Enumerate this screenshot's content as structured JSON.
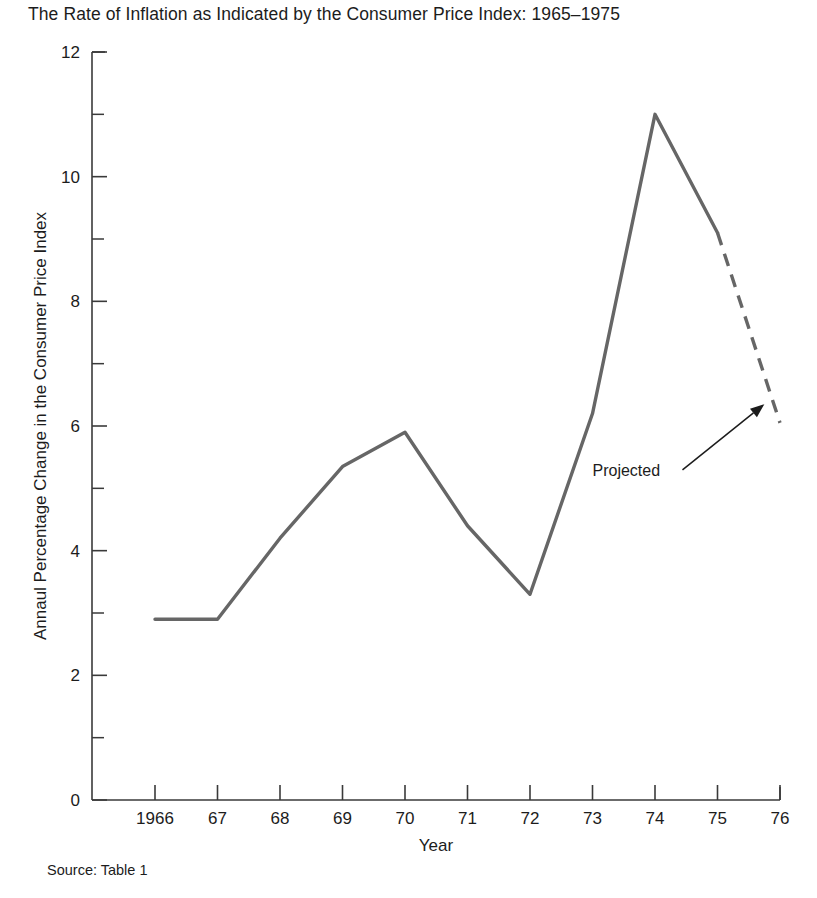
{
  "chart_data": {
    "type": "line",
    "title": "The Rate of Inflation as Indicated by the Consumer Price Index: 1965–1975",
    "xlabel": "Year",
    "ylabel": "Annaul Percentage Change in the Consumer Price Index",
    "xlim": [
      1966,
      1976
    ],
    "ylim": [
      0,
      12
    ],
    "grid": false,
    "legend": "none",
    "x": [
      1966,
      1967,
      1968,
      1969,
      1970,
      1971,
      1972,
      1973,
      1974,
      1975,
      1976
    ],
    "xtick_labels": [
      "1966",
      "67",
      "68",
      "69",
      "70",
      "71",
      "72",
      "73",
      "74",
      "75",
      "76"
    ],
    "ytick_labels": [
      "0",
      "2",
      "4",
      "6",
      "8",
      "10",
      "12"
    ],
    "ytick_values": [
      0,
      2,
      4,
      6,
      8,
      10,
      12
    ],
    "yminor_values": [
      1,
      3,
      5,
      7,
      9,
      11
    ],
    "series": [
      {
        "name": "Annual percentage change in CPI",
        "values": [
          2.9,
          2.9,
          4.2,
          5.35,
          5.9,
          4.4,
          3.3,
          6.2,
          11.0,
          9.1,
          6.05
        ],
        "style": "solid",
        "color": "#666666",
        "solid_through_year": 1975
      },
      {
        "name": "Projected",
        "values": [
          9.1,
          6.05
        ],
        "x": [
          1975,
          1976
        ],
        "style": "dashed",
        "color": "#666666"
      }
    ],
    "annotations": [
      {
        "label": "Projected",
        "label_x": 1973.0,
        "label_y": 5.2,
        "arrow_target_x": 1975.75,
        "arrow_target_y": 6.35
      }
    ]
  },
  "source": {
    "text": "Source: Table 1"
  }
}
